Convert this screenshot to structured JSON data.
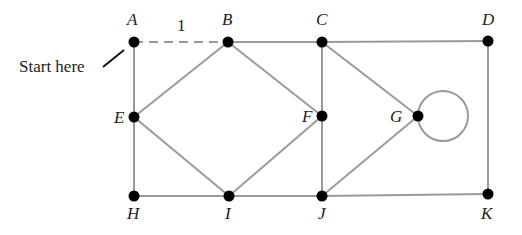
{
  "diagram": {
    "type": "graph",
    "start_note": "Start here",
    "edge_colors": {
      "edge": "#9a9a9a",
      "node": "#000000"
    },
    "nodes": [
      {
        "id": "A",
        "x": 134,
        "y": 42,
        "lx": 127,
        "ly": 25
      },
      {
        "id": "B",
        "x": 228,
        "y": 42,
        "lx": 222,
        "ly": 25
      },
      {
        "id": "C",
        "x": 322,
        "y": 42,
        "lx": 316,
        "ly": 25
      },
      {
        "id": "D",
        "x": 488,
        "y": 41,
        "lx": 482,
        "ly": 25
      },
      {
        "id": "E",
        "x": 134,
        "y": 117,
        "lx": 114,
        "ly": 123
      },
      {
        "id": "F",
        "x": 322,
        "y": 116,
        "lx": 302,
        "ly": 122
      },
      {
        "id": "G",
        "x": 418,
        "y": 116,
        "lx": 390,
        "ly": 122
      },
      {
        "id": "H",
        "x": 134,
        "y": 196,
        "lx": 127,
        "ly": 219
      },
      {
        "id": "I",
        "x": 229,
        "y": 196,
        "lx": 225,
        "ly": 219
      },
      {
        "id": "J",
        "x": 322,
        "y": 196,
        "lx": 318,
        "ly": 219
      },
      {
        "id": "K",
        "x": 488,
        "y": 194,
        "lx": 481,
        "ly": 219
      }
    ],
    "edges": [
      {
        "from": "A",
        "to": "B",
        "style": "dashed",
        "label": "1"
      },
      {
        "from": "B",
        "to": "C"
      },
      {
        "from": "C",
        "to": "D"
      },
      {
        "from": "A",
        "to": "E"
      },
      {
        "from": "B",
        "to": "E"
      },
      {
        "from": "B",
        "to": "F"
      },
      {
        "from": "C",
        "to": "F"
      },
      {
        "from": "C",
        "to": "G"
      },
      {
        "from": "D",
        "to": "K"
      },
      {
        "from": "E",
        "to": "H"
      },
      {
        "from": "E",
        "to": "I"
      },
      {
        "from": "F",
        "to": "I"
      },
      {
        "from": "F",
        "to": "J"
      },
      {
        "from": "G",
        "to": "J"
      },
      {
        "from": "H",
        "to": "I"
      },
      {
        "from": "I",
        "to": "J"
      },
      {
        "from": "J",
        "to": "K"
      },
      {
        "from": "G",
        "to": "G",
        "type": "loop"
      }
    ],
    "edge_label_AB": "1"
  }
}
